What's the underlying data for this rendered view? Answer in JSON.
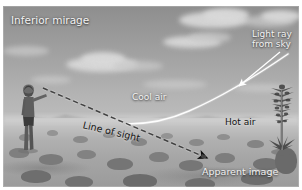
{
  "figure": {
    "kind": "annotated-photograph"
  },
  "labels": {
    "title": "Inferior mirage",
    "light_ray_line1": "Light ray",
    "light_ray_line2": "from sky",
    "cool_air": "Cool air",
    "hot_air": "Hot air",
    "line_of_sight": "Line of sight",
    "apparent_image": "Apparent image"
  },
  "colors": {
    "white_text": "#f2f2f2",
    "black_text": "#141414",
    "ray_stroke": "#ffffff",
    "sight_stroke": "#101010",
    "plate_border": "#ffffff",
    "sky_top": "#8e8e8e",
    "sky_bottom": "#bdbdbd",
    "ground": "#b0b0b0"
  },
  "scene": {
    "observer": "person standing at left edge",
    "plant": "yucca stalk at right edge",
    "horizon": "distant mountain range",
    "ground": "open desert floor with scattered scrub"
  },
  "annotations": {
    "light_ray_arrow": "arrow from the 'Light ray from sky' label down-left to the curved ray",
    "ray_path": "solid white curve bending from upper right down to horizontal near the hot ground",
    "sight_path": "black dashed straight line from the observer's eye down-right to the apparent image",
    "sight_arrowhead": "arrowhead at lower-right end of the dashed line of sight"
  }
}
